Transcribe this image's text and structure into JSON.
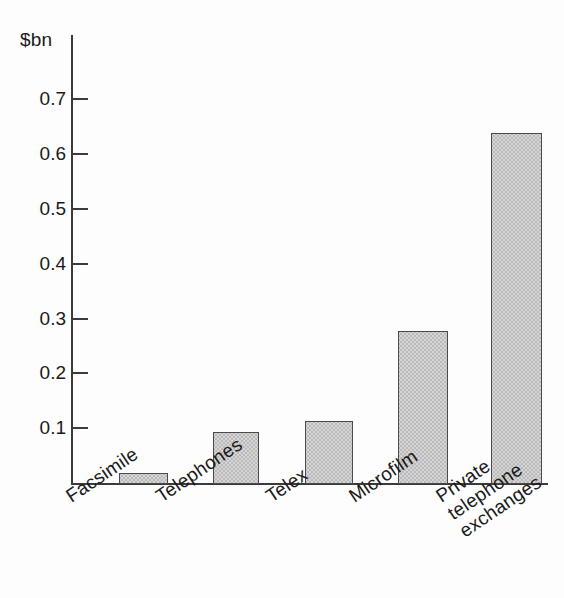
{
  "chart_data": {
    "type": "bar",
    "title": "",
    "subtitle": "",
    "xlabel": "",
    "ylabel": "$bn",
    "unit_label": "$bn",
    "categories": [
      "Facsimile",
      "Telephones",
      "Telex",
      "Microfilm",
      "Private\ntelephone\nexchanges"
    ],
    "values": [
      0.02,
      0.095,
      0.115,
      0.28,
      0.64
    ],
    "ylim": [
      0,
      0.77
    ],
    "yticks": [
      0.1,
      0.2,
      0.3,
      0.4,
      0.5,
      0.6,
      0.7
    ],
    "ytick_labels": [
      "0.1",
      "0.2",
      "0.3",
      "0.4",
      "0.5",
      "0.6",
      "0.7"
    ],
    "grid": false,
    "legend": false,
    "legend_position": "none",
    "bar_fill_color": "#d6d6d6",
    "bar_border_color": "#4a4a4a",
    "axis_color": "#3b3b3b"
  },
  "axis": {
    "unit": "$bn"
  },
  "categories": [
    {
      "label": "Facsimile",
      "label_lines": [
        "Facsimile"
      ],
      "value": 0.02
    },
    {
      "label": "Telephones",
      "label_lines": [
        "Telephones"
      ],
      "value": 0.095
    },
    {
      "label": "Telex",
      "label_lines": [
        "Telex"
      ],
      "value": 0.115
    },
    {
      "label": "Microfilm",
      "label_lines": [
        "Microfilm"
      ],
      "value": 0.28
    },
    {
      "label": "Private telephone exchanges",
      "label_lines": [
        "Private",
        "telephone",
        "exchanges"
      ],
      "value": 0.64
    }
  ],
  "ticks": [
    {
      "label": "0.7",
      "value": 0.7
    },
    {
      "label": "0.6",
      "value": 0.6
    },
    {
      "label": "0.5",
      "value": 0.5
    },
    {
      "label": "0.4",
      "value": 0.4
    },
    {
      "label": "0.3",
      "value": 0.3
    },
    {
      "label": "0.2",
      "value": 0.2
    },
    {
      "label": "0.1",
      "value": 0.1
    }
  ]
}
